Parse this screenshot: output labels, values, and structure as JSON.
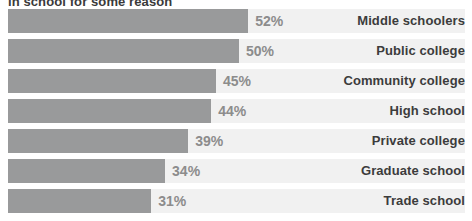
{
  "chart_data": {
    "type": "bar",
    "orientation": "horizontal",
    "title": "in school for some reason",
    "categories": [
      "Middle schoolers",
      "Public college",
      "Community college",
      "High school",
      "Private college",
      "Graduate school",
      "Trade school"
    ],
    "values": [
      52,
      50,
      45,
      44,
      39,
      34,
      31
    ],
    "value_labels": [
      "52%",
      "50%",
      "45%",
      "44%",
      "39%",
      "34%",
      "31%"
    ],
    "xlabel": "",
    "ylabel": "",
    "xlim": [
      0,
      100
    ],
    "grid": false,
    "legend": null,
    "colors": {
      "bar": "#999a9b",
      "track": "#f1f1f1",
      "value_text": "#8c8c8c",
      "category_text": "#3c3c3c",
      "background": "#ffffff"
    }
  }
}
